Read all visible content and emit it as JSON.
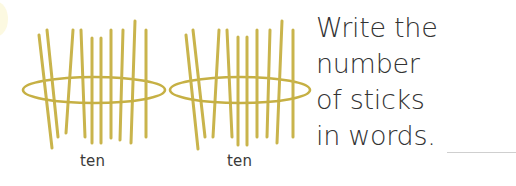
{
  "bundles": [
    {
      "label": "ten",
      "stick_count": 10,
      "band": {
        "cx": 94,
        "cy": 90,
        "rx": 71,
        "ry": 13
      },
      "sticks": [
        [
          39,
          35,
          52,
          148
        ],
        [
          47,
          30,
          58,
          137
        ],
        [
          73,
          30,
          66,
          133
        ],
        [
          81,
          30,
          85,
          137
        ],
        [
          92,
          38,
          92,
          143
        ],
        [
          101,
          38,
          101,
          143
        ],
        [
          111,
          30,
          111,
          138
        ],
        [
          123,
          30,
          120,
          140
        ],
        [
          135,
          21,
          131,
          143
        ],
        [
          146,
          30,
          146,
          137
        ]
      ]
    },
    {
      "label": "ten",
      "stick_count": 10,
      "band": {
        "cx": 240,
        "cy": 90,
        "rx": 70,
        "ry": 13
      },
      "sticks": [
        [
          186,
          35,
          198,
          149
        ],
        [
          193,
          30,
          205,
          137
        ],
        [
          219,
          30,
          213,
          137
        ],
        [
          227,
          30,
          232,
          137
        ],
        [
          238,
          37,
          238,
          145
        ],
        [
          247,
          37,
          247,
          145
        ],
        [
          257,
          30,
          257,
          137
        ],
        [
          270,
          30,
          267,
          137
        ],
        [
          282,
          21,
          277,
          143
        ],
        [
          293,
          30,
          293,
          137
        ]
      ]
    }
  ],
  "instruction": {
    "lines": [
      "Write the",
      "number",
      "of sticks",
      "in words."
    ]
  },
  "answer": {
    "value": ""
  },
  "colors": {
    "stick": "#c9b44c",
    "band": "#c6b044",
    "text": "#333333",
    "blank_line": "#cfcfcf"
  }
}
